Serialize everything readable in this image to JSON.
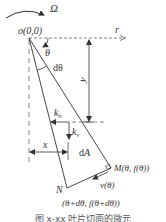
{
  "diagram": {
    "rotation_label": "Ω",
    "origin_label": "o(0,0)",
    "r_axis_label": "r",
    "theta_label": "θ",
    "dtheta_label": "dθ",
    "y_label": "y",
    "kh_label_main": "k",
    "kh_label_sub": "h",
    "kv_label_main": "k",
    "kv_label_sub": "v",
    "x_label": "x",
    "dA_label": "dA",
    "M_label": "M(θ, f(θ))",
    "v_label": "v(θ)",
    "N_label": "N",
    "N_coords_label": "(θ+dθ, f(θ+dθ))",
    "caption": "图 x-xx  叶片切面的微元",
    "colors": {
      "line": "#333333",
      "dashed": "#666666",
      "background": "#ffffff"
    }
  }
}
